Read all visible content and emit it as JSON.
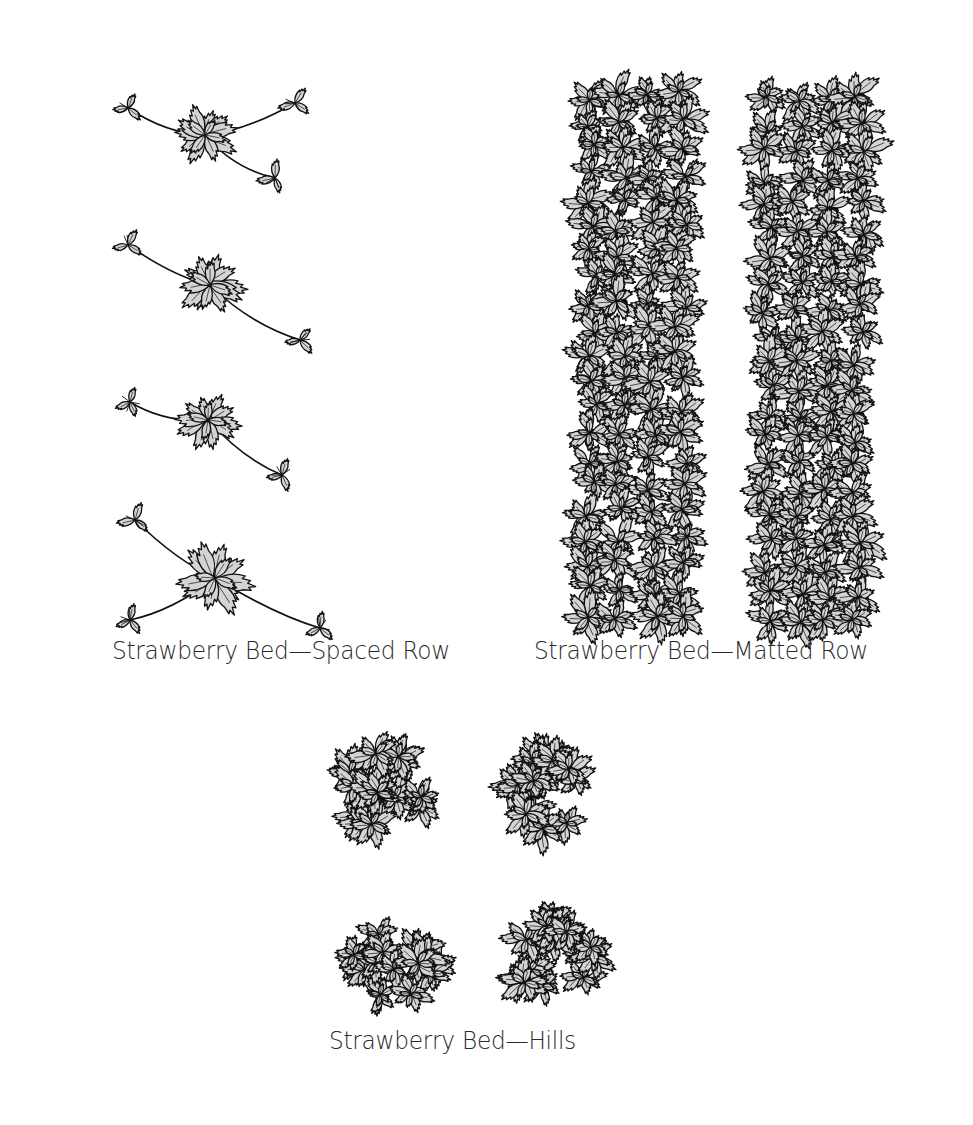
{
  "figure": {
    "colors": {
      "background": "#ffffff",
      "leaf_fill": "#d4d4d4",
      "leaf_outline": "#111111",
      "shadow": "#0c0c0c",
      "caption_text": "#2a2a2a"
    },
    "panels": [
      {
        "id": "spaced-row",
        "caption": "Strawberry Bed—Spaced Row",
        "plant_count": 4,
        "plants": [
          {
            "cx": 205,
            "cy": 135,
            "r": 38,
            "runners": [
              [
                128,
                108
              ],
              [
                295,
                103
              ],
              [
                275,
                178
              ]
            ]
          },
          {
            "cx": 210,
            "cy": 285,
            "r": 42,
            "runners": [
              [
                128,
                245
              ],
              [
                300,
                340
              ]
            ]
          },
          {
            "cx": 208,
            "cy": 420,
            "r": 36,
            "runners": [
              [
                130,
                402
              ],
              [
                282,
                475
              ]
            ]
          },
          {
            "cx": 215,
            "cy": 578,
            "r": 44,
            "runners": [
              [
                135,
                520
              ],
              [
                130,
                620
              ],
              [
                320,
                628
              ]
            ]
          }
        ]
      },
      {
        "id": "matted-row",
        "caption": "Strawberry Bed—Matted Row",
        "rows": [
          {
            "x": 575,
            "y": 78,
            "width": 130,
            "height": 560
          },
          {
            "x": 752,
            "y": 83,
            "width": 130,
            "height": 555
          }
        ]
      },
      {
        "id": "hills",
        "caption": "Strawberry Bed—Hills",
        "clumps": [
          {
            "cx": 382,
            "cy": 792,
            "r": 62
          },
          {
            "cx": 550,
            "cy": 797,
            "r": 64
          },
          {
            "cx": 395,
            "cy": 958,
            "r": 62
          },
          {
            "cx": 555,
            "cy": 955,
            "r": 64
          }
        ]
      }
    ]
  }
}
